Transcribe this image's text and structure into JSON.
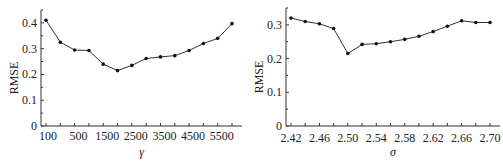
{
  "chart_data": [
    {
      "type": "line",
      "title": "",
      "xlabel": "γ",
      "ylabel": "RMSE",
      "ylim": [
        0,
        0.45
      ],
      "yticks": [
        "0",
        "0.1",
        "0.2",
        "0.3",
        "0.4"
      ],
      "xtick_labels": [
        "100",
        "500",
        "1500",
        "2500",
        "3500",
        "4500",
        "5500"
      ],
      "grid": false,
      "legend": null,
      "x": [
        "100",
        "300",
        "500",
        "1000",
        "1500",
        "2000",
        "2500",
        "3000",
        "3500",
        "4000",
        "4500",
        "5000",
        "5500",
        "6000"
      ],
      "values": [
        0.41,
        0.325,
        0.295,
        0.293,
        0.24,
        0.215,
        0.235,
        0.262,
        0.268,
        0.273,
        0.293,
        0.32,
        0.34,
        0.397
      ]
    },
    {
      "type": "line",
      "title": "",
      "xlabel": "σ",
      "ylabel": "RMSE",
      "ylim": [
        0,
        0.35
      ],
      "yticks": [
        "0",
        "0.1",
        "0.2",
        "0.3"
      ],
      "xtick_labels": [
        "2.42",
        "2.46",
        "2.50",
        "2.54",
        "2.58",
        "2.62",
        "2.66",
        "2.70"
      ],
      "grid": false,
      "legend": null,
      "x": [
        "2.42",
        "2.44",
        "2.46",
        "2.48",
        "2.50",
        "2.52",
        "2.54",
        "2.56",
        "2.58",
        "2.60",
        "2.62",
        "2.64",
        "2.66",
        "2.68",
        "2.70"
      ],
      "values": [
        0.32,
        0.31,
        0.303,
        0.289,
        0.215,
        0.242,
        0.244,
        0.25,
        0.257,
        0.266,
        0.28,
        0.296,
        0.312,
        0.307,
        0.307
      ]
    }
  ]
}
